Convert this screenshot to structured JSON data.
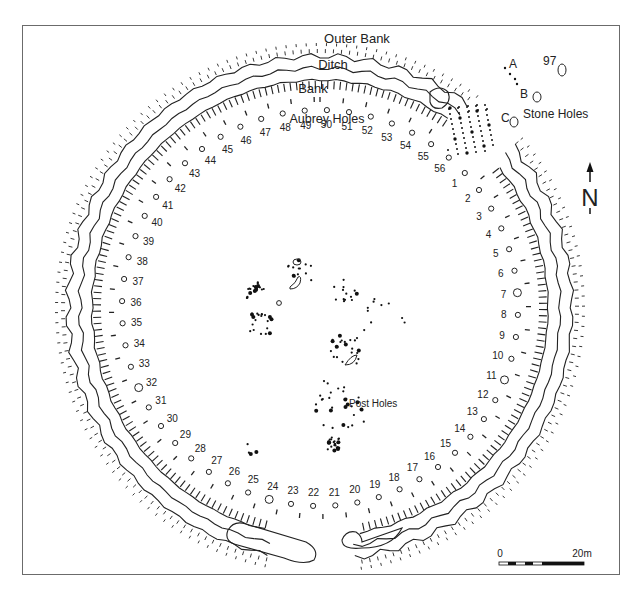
{
  "labels": {
    "outer_bank": "Outer Bank",
    "ditch": "Ditch",
    "bank": "Bank",
    "aubrey_holes": "Aubrey Holes",
    "post_holes": "Post Holes",
    "stone_holes": "Stone Holes",
    "stone_a": "A",
    "stone_b": "B",
    "stone_c": "C",
    "stone_97": "97"
  },
  "north_arrow": {
    "label": "N",
    "icon": "north-arrow-icon"
  },
  "scale_bar": {
    "start_label": "0",
    "end_label": "20m",
    "segments": 5
  },
  "aubrey_holes": [
    "1",
    "2",
    "3",
    "4",
    "5",
    "6",
    "7",
    "8",
    "9",
    "10",
    "11",
    "12",
    "13",
    "14",
    "15",
    "16",
    "17",
    "18",
    "19",
    "20",
    "21",
    "22",
    "23",
    "24",
    "25",
    "26",
    "27",
    "28",
    "29",
    "30",
    "31",
    "32",
    "33",
    "34",
    "35",
    "36",
    "37",
    "38",
    "39",
    "40",
    "41",
    "42",
    "43",
    "44",
    "45",
    "46",
    "47",
    "48",
    "49",
    "50",
    "51",
    "52",
    "53",
    "54",
    "55",
    "56"
  ],
  "colors": {
    "ink": "#222222",
    "frame": "#6b6b6b",
    "background": "#ffffff"
  }
}
